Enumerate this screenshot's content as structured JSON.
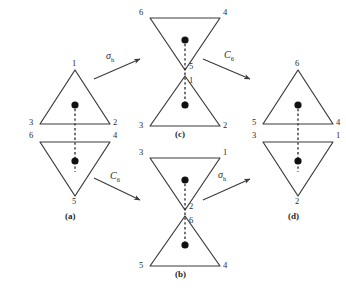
{
  "figure": {
    "type": "symmetry-operation-diagram",
    "background_color": "#ffffff",
    "line_color": "#3a3a3a",
    "dot_color": "#111111"
  },
  "structures": [
    {
      "id": "a",
      "caption": "(a)",
      "shape": "two-separated-triangles",
      "top_triangle": {
        "orientation": "up",
        "apex_label": "1",
        "left_label": "3",
        "right_label": "2"
      },
      "bottom_triangle": {
        "orientation": "down",
        "apex_label": "5",
        "left_label": "6",
        "right_label": "4"
      }
    },
    {
      "id": "c",
      "caption": "(c)",
      "shape": "hourglass",
      "top_triangle": {
        "orientation": "down",
        "apex_label": "5",
        "left_label": "6",
        "right_label": "4"
      },
      "bottom_triangle": {
        "orientation": "up",
        "apex_label": "1",
        "left_label": "3",
        "right_label": "2"
      }
    },
    {
      "id": "b",
      "caption": "(b)",
      "shape": "hourglass",
      "top_triangle": {
        "orientation": "down",
        "apex_label": "2",
        "left_label": "3",
        "right_label": "1"
      },
      "bottom_triangle": {
        "orientation": "up",
        "apex_label": "6",
        "left_label": "5",
        "right_label": "4"
      }
    },
    {
      "id": "d",
      "caption": "(d)",
      "shape": "two-separated-triangles",
      "top_triangle": {
        "orientation": "up",
        "apex_label": "6",
        "left_label": "5",
        "right_label": "4"
      },
      "bottom_triangle": {
        "orientation": "down",
        "apex_label": "2",
        "left_label": "3",
        "right_label": "1"
      }
    }
  ],
  "arrows": [
    {
      "id": "a-to-c",
      "operation": "σ",
      "subscript": "h",
      "from": "a",
      "to": "c",
      "direction": "up-right"
    },
    {
      "id": "c-to-d",
      "operation": "C",
      "subscript": "6",
      "from": "c",
      "to": "d",
      "direction": "down-right"
    },
    {
      "id": "a-to-b",
      "operation": "C",
      "subscript": "6",
      "from": "a",
      "to": "b",
      "direction": "down-right"
    },
    {
      "id": "b-to-d",
      "operation": "σ",
      "subscript": "h",
      "from": "b",
      "to": "d",
      "direction": "up-right"
    }
  ]
}
